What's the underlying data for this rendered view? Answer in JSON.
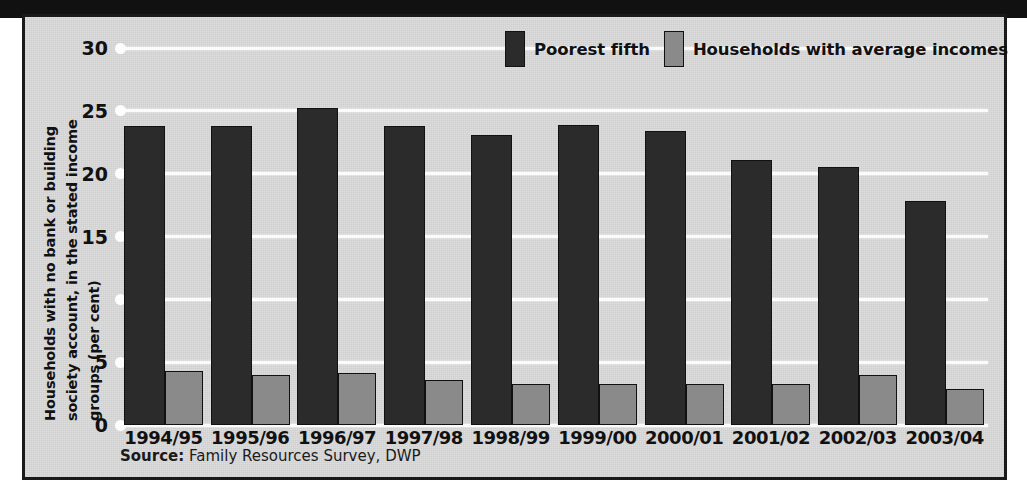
{
  "chart_data": {
    "type": "bar",
    "title": "",
    "subtitle": "",
    "xlabel": "",
    "ylabel": "Households with no bank or building society account, in the stated income groups (per cent)",
    "ylabel_lines": [
      "Households with no bank or building",
      "society account, in the stated income",
      "groups (per cent)"
    ],
    "ylim": [
      0,
      30
    ],
    "ytick_values": [
      30,
      25,
      20,
      15,
      10,
      5,
      0
    ],
    "ytick_labels": [
      "30",
      "25",
      "20",
      "15",
      "",
      "5",
      "0"
    ],
    "grid": true,
    "grid_axis": "y",
    "legend_position": "top-right",
    "categories": [
      "1994/95",
      "1995/96",
      "1996/97",
      "1997/98",
      "1998/99",
      "1999/00",
      "2000/01",
      "2001/02",
      "2002/03",
      "2003/04"
    ],
    "series": [
      {
        "name": "Poorest fifth",
        "color": "#2b2b2b",
        "values": [
          23.8,
          23.8,
          25.2,
          23.8,
          23.1,
          23.9,
          23.4,
          21.1,
          20.5,
          17.8
        ]
      },
      {
        "name": "Households with average incomes",
        "color": "#8a8a8a",
        "values": [
          4.3,
          4.0,
          4.1,
          3.6,
          3.3,
          3.3,
          3.3,
          3.3,
          4.0,
          2.9
        ]
      }
    ],
    "source_key": "Source:",
    "source_value": " Family Resources Survey, DWP"
  },
  "colors": {
    "poorest_fifth": "#2b2b2b",
    "average_incomes": "#8a8a8a",
    "plate_background": "#dcdcdc",
    "gridline": "#fbfbfb",
    "frame": "#1a1a1a",
    "text": "#111111"
  }
}
